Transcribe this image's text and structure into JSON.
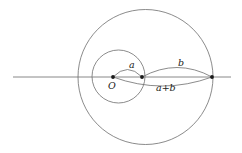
{
  "figure": {
    "background_color": "#ffffff",
    "stroke_color": "#5a5a5a",
    "text_color": "#1a1a1a",
    "axis": {
      "label": "horizontal-axis",
      "y": 77,
      "x_start": 13,
      "x_end": 231
    },
    "points": [
      {
        "id": "O",
        "label": "O",
        "x": 113,
        "y": 77,
        "dot": true
      },
      {
        "id": "P_a",
        "label": "",
        "x": 142,
        "y": 77,
        "dot": true
      },
      {
        "id": "P_ab",
        "label": "",
        "x": 212,
        "y": 77,
        "dot": true
      }
    ],
    "circles": [
      {
        "id": "small-circle",
        "cx": 118.5,
        "cy": 76.5,
        "r": 26.5
      },
      {
        "id": "large-circle",
        "cx": 145.5,
        "cy": 77.0,
        "r": 67.5
      }
    ],
    "arcs": [
      {
        "id": "arc-a",
        "from": "O",
        "to": "P_a",
        "bulge": -8,
        "label": "a"
      },
      {
        "id": "arc-b",
        "from": "P_a",
        "to": "P_ab",
        "bulge": -10,
        "label": "b"
      },
      {
        "id": "arc-apb",
        "from": "O",
        "to": "P_ab",
        "bulge": 9,
        "label": "a+b"
      }
    ],
    "labels": {
      "a": "a",
      "b": "b",
      "a_plus_b": "a+b",
      "origin": "O"
    }
  }
}
